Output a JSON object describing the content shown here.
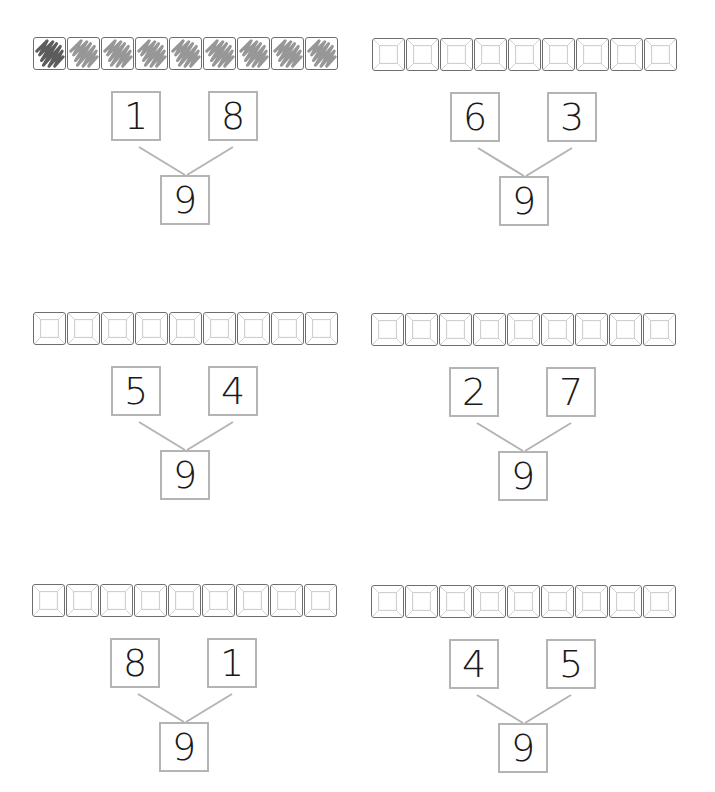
{
  "worksheet": {
    "panels": [
      {
        "id": "top-left",
        "left_part": "1",
        "right_part": "8",
        "whole": "9",
        "tile_count": 9,
        "shaded_dark": 1,
        "shaded_light": 8
      },
      {
        "id": "top-right",
        "left_part": "6",
        "right_part": "3",
        "whole": "9",
        "tile_count": 9,
        "shaded_dark": 0,
        "shaded_light": 0
      },
      {
        "id": "middle-left",
        "left_part": "5",
        "right_part": "4",
        "whole": "9",
        "tile_count": 9,
        "shaded_dark": 0,
        "shaded_light": 0
      },
      {
        "id": "middle-right",
        "left_part": "2",
        "right_part": "7",
        "whole": "9",
        "tile_count": 9,
        "shaded_dark": 0,
        "shaded_light": 0
      },
      {
        "id": "bottom-left",
        "left_part": "8",
        "right_part": "1",
        "whole": "9",
        "tile_count": 9,
        "shaded_dark": 0,
        "shaded_light": 0
      },
      {
        "id": "bottom-right",
        "left_part": "4",
        "right_part": "5",
        "whole": "9",
        "tile_count": 9,
        "shaded_dark": 0,
        "shaded_light": 0
      }
    ]
  },
  "colors": {
    "tile_border": "#6e6e6e",
    "tile_bevel": "#d0d0d0",
    "box_border": "#b4b4b4",
    "connector": "#b4b4b4",
    "shade_dark": "#4a4a4a",
    "shade_light": "#8c8c8c",
    "digit": "#1a1a1a"
  }
}
